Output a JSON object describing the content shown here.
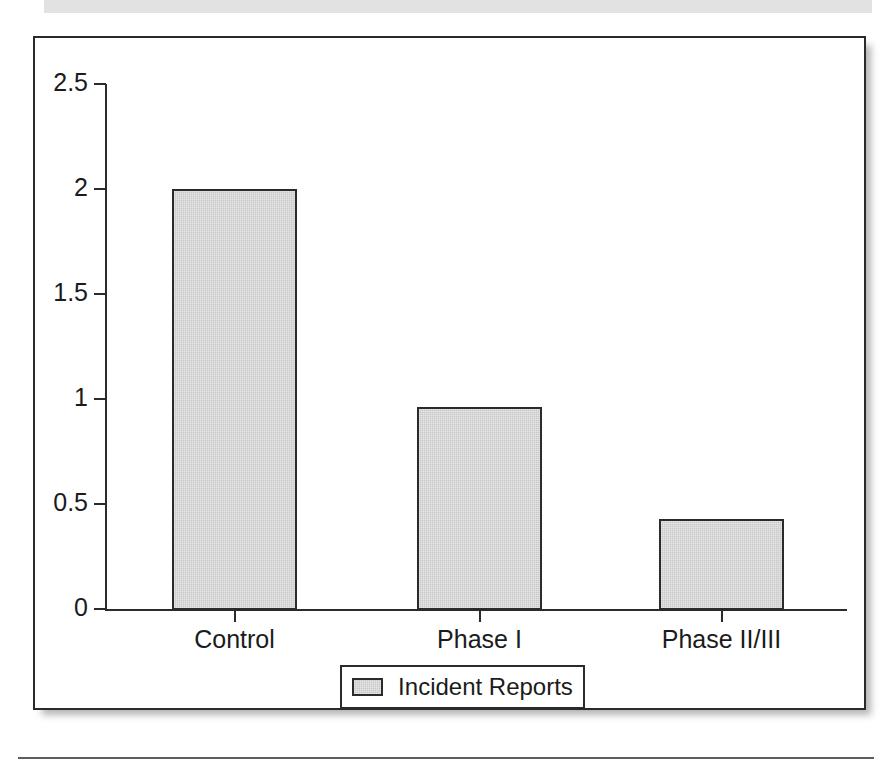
{
  "figure": {
    "frame_border_color": "#2a2a2a",
    "background_color": "#ffffff"
  },
  "chart_data": {
    "type": "bar",
    "title": "",
    "subtitle": "",
    "xlabel": "",
    "ylabel": "",
    "categories": [
      "Control",
      "Phase I",
      "Phase II/III"
    ],
    "values": [
      2.0,
      0.96,
      0.43
    ],
    "series": [
      {
        "name": "Incident Reports",
        "values": [
          2.0,
          0.96,
          0.43
        ],
        "color": "#c9c9c9"
      }
    ],
    "ylim": [
      0,
      2.5
    ],
    "ytick_labels": [
      "2.5",
      "2",
      "1.5",
      "1",
      "0.5",
      "0"
    ],
    "ytick_values": [
      2.5,
      2,
      1.5,
      1,
      0.5,
      0
    ],
    "xtick_labels": [
      "Control",
      "Phase I",
      "Phase II/III"
    ],
    "grid": false,
    "legend": {
      "position": "bottom-center",
      "entries": [
        {
          "label": "Incident Reports",
          "swatch_color": "#c9c9c9",
          "swatch_name": "legend-swatch"
        }
      ]
    },
    "annotations": []
  }
}
